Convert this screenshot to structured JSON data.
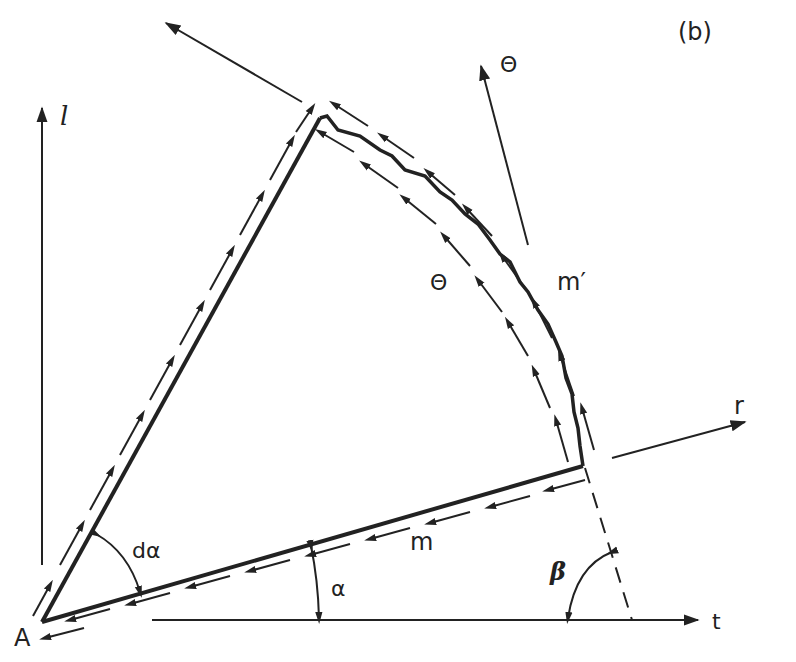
{
  "figure": {
    "panel_label": "(b)",
    "colors": {
      "ink": "#222222",
      "background": "#ffffff"
    }
  },
  "labels": {
    "axis_l": "l",
    "axis_t": "t",
    "axis_r": "r",
    "theta_direction": "Θ",
    "theta_segment": "Θ",
    "m_prime": "m′",
    "m": "m",
    "d_alpha": "dα",
    "alpha": "α",
    "beta": "β",
    "point_a": "A"
  }
}
